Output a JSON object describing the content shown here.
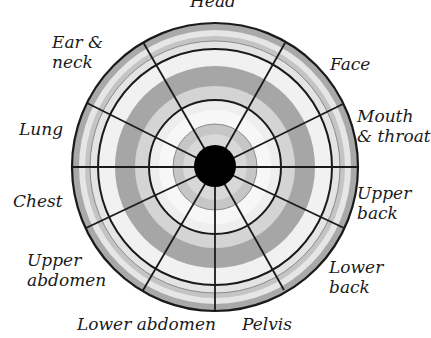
{
  "diagram": {
    "type": "polar-body-region-target",
    "center_marker": "filled black circle",
    "colors": {
      "outline": "#1a1a1a",
      "band_dark": "#a9a9a9",
      "band_mid": "#c9c9c9",
      "band_light": "#e4e4e4",
      "band_white": "#f3f3f3",
      "center": "#000000"
    },
    "labels": {
      "head": [
        "Head"
      ],
      "face": [
        "Face"
      ],
      "mouth_throat": [
        "Mouth",
        "& throat"
      ],
      "upper_back": [
        "Upper",
        "back"
      ],
      "lower_back": [
        "Lower",
        "back"
      ],
      "pelvis": [
        "Pelvis"
      ],
      "lower_abdomen": [
        "Lower abdomen"
      ],
      "upper_abdomen": [
        "Upper",
        "abdomen"
      ],
      "chest": [
        "Chest"
      ],
      "lung": [
        "Lung"
      ],
      "ear_neck": [
        "Ear &",
        "neck"
      ]
    }
  }
}
